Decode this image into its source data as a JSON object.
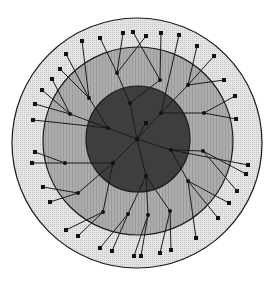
{
  "diagram": {
    "type": "radial-tree",
    "width": 275,
    "height": 286,
    "colors": {
      "background": "#ffffff",
      "outer_ring": "#e2e2e2",
      "middle_ring": "#a9a9a9",
      "inner_disc": "#3e3e3e",
      "stroke": "#1a1a1a",
      "node": "#111111"
    },
    "rings": [
      {
        "name": "outer",
        "cx": 137,
        "cy": 143,
        "rx": 125,
        "ry": 125
      },
      {
        "name": "middle",
        "cx": 138,
        "cy": 141,
        "rx": 95,
        "ry": 94
      },
      {
        "name": "inner",
        "cx": 138,
        "cy": 139,
        "rx": 52,
        "ry": 53
      }
    ],
    "root": {
      "x": 137,
      "y": 139
    },
    "hubs": [
      {
        "id": "h1",
        "x": 130,
        "y": 103,
        "parent": "root"
      },
      {
        "id": "h2",
        "x": 161,
        "y": 113,
        "parent": "root"
      },
      {
        "id": "h3",
        "x": 108,
        "y": 128,
        "parent": "root"
      },
      {
        "id": "h4",
        "x": 171,
        "y": 150,
        "parent": "root"
      },
      {
        "id": "h5",
        "x": 113,
        "y": 163,
        "parent": "root"
      },
      {
        "id": "h6",
        "x": 146,
        "y": 176,
        "parent": "root"
      },
      {
        "id": "h7",
        "x": 160,
        "y": 80,
        "parent": "h1"
      },
      {
        "id": "h8",
        "x": 117,
        "y": 73,
        "parent": "h1"
      },
      {
        "id": "h9",
        "x": 188,
        "y": 85,
        "parent": "h2"
      },
      {
        "id": "h10",
        "x": 89,
        "y": 98,
        "parent": "h3"
      },
      {
        "id": "h11",
        "x": 70,
        "y": 114,
        "parent": "h3"
      },
      {
        "id": "h12",
        "x": 204,
        "y": 113,
        "parent": "h2"
      },
      {
        "id": "h13",
        "x": 65,
        "y": 163,
        "parent": "h5"
      },
      {
        "id": "h14",
        "x": 203,
        "y": 151,
        "parent": "h4"
      },
      {
        "id": "h15",
        "x": 78,
        "y": 193,
        "parent": "h5"
      },
      {
        "id": "h16",
        "x": 188,
        "y": 181,
        "parent": "h4"
      },
      {
        "id": "h17",
        "x": 103,
        "y": 212,
        "parent": "h5"
      },
      {
        "id": "h18",
        "x": 170,
        "y": 211,
        "parent": "h6"
      },
      {
        "id": "h19",
        "x": 128,
        "y": 214,
        "parent": "h6"
      },
      {
        "id": "h20",
        "x": 148,
        "y": 215,
        "parent": "h6"
      }
    ],
    "leaves": [
      {
        "x": 123,
        "y": 33,
        "parent": "h8"
      },
      {
        "x": 133,
        "y": 32,
        "parent": "h7"
      },
      {
        "x": 146,
        "y": 36,
        "parent": "h8"
      },
      {
        "x": 161,
        "y": 33,
        "parent": "h7"
      },
      {
        "x": 100,
        "y": 38,
        "parent": "h8"
      },
      {
        "x": 82,
        "y": 41,
        "parent": "h10"
      },
      {
        "x": 66,
        "y": 54,
        "parent": "h10"
      },
      {
        "x": 60,
        "y": 69,
        "parent": "h10"
      },
      {
        "x": 52,
        "y": 79,
        "parent": "h11"
      },
      {
        "x": 42,
        "y": 90,
        "parent": "h11"
      },
      {
        "x": 35,
        "y": 104,
        "parent": "h11"
      },
      {
        "x": 33,
        "y": 120,
        "parent": "h3"
      },
      {
        "x": 35,
        "y": 152,
        "parent": "h13"
      },
      {
        "x": 32,
        "y": 163,
        "parent": "h13"
      },
      {
        "x": 43,
        "y": 187,
        "parent": "h15"
      },
      {
        "x": 50,
        "y": 202,
        "parent": "h15"
      },
      {
        "x": 66,
        "y": 230,
        "parent": "h17"
      },
      {
        "x": 78,
        "y": 236,
        "parent": "h17"
      },
      {
        "x": 100,
        "y": 248,
        "parent": "h19"
      },
      {
        "x": 112,
        "y": 251,
        "parent": "h19"
      },
      {
        "x": 134,
        "y": 256,
        "parent": "h20"
      },
      {
        "x": 141,
        "y": 256,
        "parent": "h20"
      },
      {
        "x": 160,
        "y": 253,
        "parent": "h18"
      },
      {
        "x": 171,
        "y": 250,
        "parent": "h18"
      },
      {
        "x": 196,
        "y": 238,
        "parent": "h16"
      },
      {
        "x": 218,
        "y": 218,
        "parent": "h16"
      },
      {
        "x": 229,
        "y": 203,
        "parent": "h16"
      },
      {
        "x": 237,
        "y": 191,
        "parent": "h14"
      },
      {
        "x": 246,
        "y": 174,
        "parent": "h14"
      },
      {
        "x": 248,
        "y": 165,
        "parent": "h4"
      },
      {
        "x": 236,
        "y": 119,
        "parent": "h12"
      },
      {
        "x": 235,
        "y": 96,
        "parent": "h12"
      },
      {
        "x": 224,
        "y": 80,
        "parent": "h9"
      },
      {
        "x": 214,
        "y": 56,
        "parent": "h9"
      },
      {
        "x": 197,
        "y": 46,
        "parent": "h9"
      },
      {
        "x": 179,
        "y": 35,
        "parent": "h2"
      },
      {
        "x": 146,
        "y": 123,
        "parent": "root"
      }
    ]
  }
}
